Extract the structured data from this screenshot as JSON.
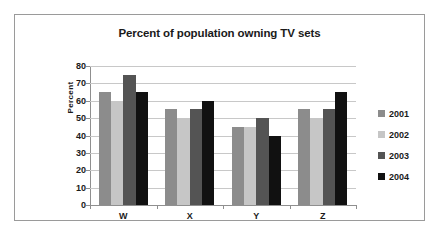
{
  "chart_data": {
    "type": "bar",
    "title": "Percent of population owning TV sets",
    "xlabel": "",
    "ylabel": "Percent",
    "categories": [
      "W",
      "X",
      "Y",
      "Z"
    ],
    "series": [
      {
        "name": "2001",
        "color": "#8c8c8c",
        "values": [
          65,
          55,
          45,
          55
        ]
      },
      {
        "name": "2002",
        "color": "#c6c6c6",
        "values": [
          60,
          50,
          45,
          50
        ]
      },
      {
        "name": "2003",
        "color": "#545454",
        "values": [
          75,
          55,
          50,
          55
        ]
      },
      {
        "name": "2004",
        "color": "#111111",
        "values": [
          65,
          60,
          40,
          65
        ]
      }
    ],
    "ylim": [
      0,
      80
    ],
    "ytick_step": 10,
    "yticks": [
      80,
      70,
      60,
      50,
      40,
      30,
      20,
      10,
      0
    ],
    "grid": true,
    "legend_position": "right"
  }
}
